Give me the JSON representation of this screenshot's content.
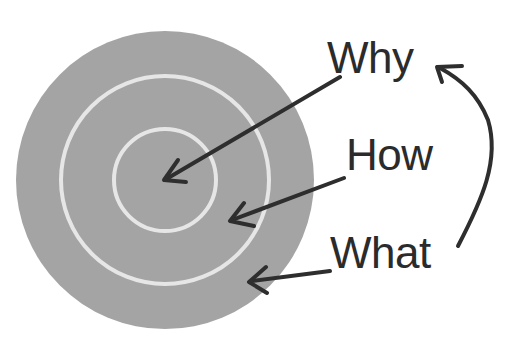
{
  "diagram": {
    "type": "golden-circle",
    "colors": {
      "circle_fill": "#a4a4a4",
      "ring_stroke": "#e6e6e6",
      "arrow": "#2e2e2e",
      "text": "#2b2b2b",
      "background": "#ffffff"
    },
    "circles": [
      {
        "name": "outer",
        "cx": 165,
        "cy": 180,
        "r": 149
      },
      {
        "name": "middle",
        "cx": 165,
        "cy": 180,
        "r": 104
      },
      {
        "name": "inner",
        "cx": 165,
        "cy": 180,
        "r": 51
      }
    ],
    "labels": {
      "why": "Why",
      "how": "How",
      "what": "What"
    },
    "arrows": [
      {
        "from": "Why",
        "to": "inner circle"
      },
      {
        "from": "How",
        "to": "middle ring"
      },
      {
        "from": "What",
        "to": "outer ring"
      },
      {
        "from": "What",
        "to": "Why",
        "style": "curved"
      }
    ]
  }
}
